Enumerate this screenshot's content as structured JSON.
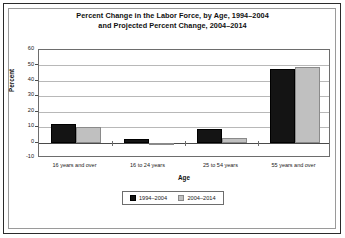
{
  "chart_data": {
    "type": "bar",
    "title": "Percent Change in the Labor Force, by Age, 1994–2004 and Projected Percent Change, 2004–2014",
    "title_lines": [
      "Percent Change in the Labor Force, by Age, 1994–2004",
      "and Projected Percent Change, 2004–2014"
    ],
    "xlabel": "Age",
    "ylabel": "Percent",
    "categories": [
      "16 years and over",
      "16 to 24 years",
      "25 to 54 years",
      "55 years and over"
    ],
    "series": [
      {
        "name": "1994–2004",
        "color": "#141414",
        "values": [
          12,
          2.5,
          9,
          48
        ]
      },
      {
        "name": "2004–2014",
        "color": "#c0c0c0",
        "values": [
          10,
          -1,
          3,
          49
        ]
      }
    ],
    "ylim": [
      -10,
      60
    ],
    "ytick_step": 10,
    "ytick_labels": [
      "60",
      "50",
      "40",
      "30",
      "20",
      "10",
      "0",
      "-10"
    ],
    "grid": "horizontal",
    "legend_position": "bottom"
  }
}
